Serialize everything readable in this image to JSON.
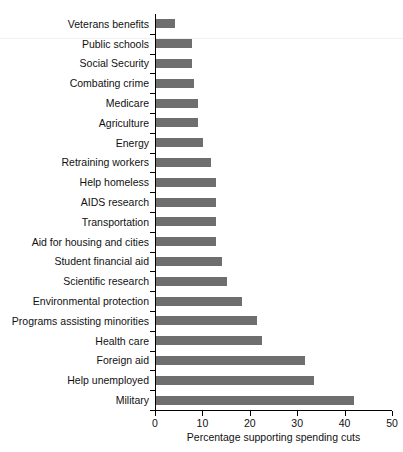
{
  "chart_data": {
    "type": "bar",
    "orientation": "horizontal",
    "title": "",
    "xlabel": "Percentage supporting spending cuts",
    "ylabel": "",
    "xlim": [
      0,
      50
    ],
    "xticks": [
      0,
      10,
      20,
      30,
      40,
      50
    ],
    "xtick_labels": [
      "0",
      "10",
      "20",
      "30",
      "40",
      "50"
    ],
    "grid": false,
    "legend": null,
    "bar_color": "#6e6e6e",
    "axis_color": "#000000",
    "categories": [
      "Veterans benefits",
      "Public schools",
      "Social Security",
      "Combating crime",
      "Medicare",
      "Agriculture",
      "Energy",
      "Retraining workers",
      "Help homeless",
      "AIDS research",
      "Transportation",
      "Aid for housing and cities",
      "Student financial aid",
      "Scientific research",
      "Environmental protection",
      "Programs assisting minorities",
      "Health care",
      "Foreign aid",
      "Help unemployed",
      "Military"
    ],
    "values": [
      4.1,
      7.7,
      7.7,
      8.0,
      8.8,
      8.8,
      10.0,
      11.5,
      12.6,
      12.6,
      12.6,
      12.6,
      14.0,
      15.0,
      18.1,
      21.3,
      22.3,
      31.4,
      33.3,
      41.8
    ]
  }
}
